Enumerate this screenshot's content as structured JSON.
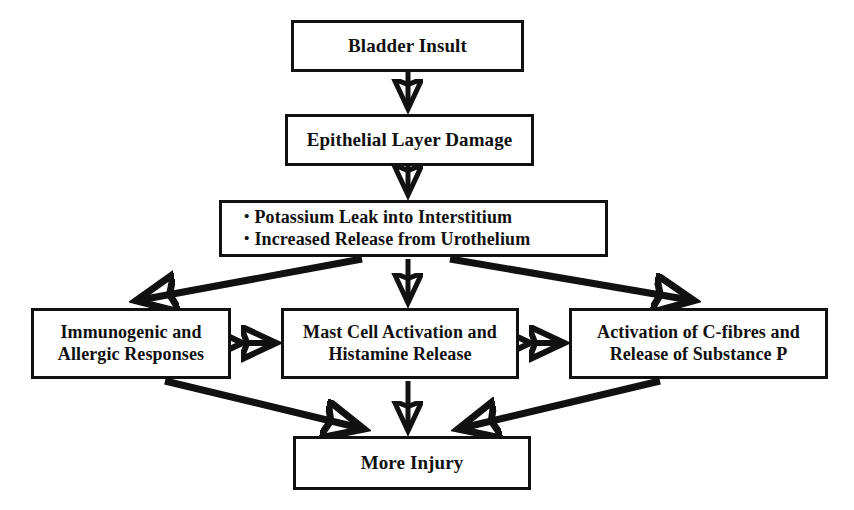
{
  "diagram": {
    "background_color": "#ffffff",
    "stroke_color": "#111111",
    "box_fill_color": "#ffffff",
    "nodes": [
      {
        "id": "bladder-insult",
        "lines": [
          "Bladder Insult"
        ],
        "x": 291,
        "y": 20,
        "w": 233,
        "h": 52,
        "font_size": 19
      },
      {
        "id": "epithelial-layer-damage",
        "lines": [
          "Epithelial Layer Damage"
        ],
        "x": 285,
        "y": 114,
        "w": 249,
        "h": 52,
        "font_size": 19
      },
      {
        "id": "potassium-leak",
        "lines": [
          "Potassium Leak into Interstitium",
          "Increased Release from Urothelium"
        ],
        "x": 219,
        "y": 200,
        "w": 389,
        "h": 57,
        "font_size": 18
      },
      {
        "id": "immunogenic-allergic",
        "lines": [
          "Immunogenic and",
          "Allergic Responses"
        ],
        "x": 31,
        "y": 308,
        "w": 200,
        "h": 71,
        "font_size": 18
      },
      {
        "id": "mast-cell-histamine",
        "lines": [
          "Mast Cell Activation and",
          "Histamine Release"
        ],
        "x": 281,
        "y": 308,
        "w": 238,
        "h": 71,
        "font_size": 18
      },
      {
        "id": "c-fibres-substance-p",
        "lines": [
          "Activation of C-fibres and",
          "Release of Substance P"
        ],
        "x": 569,
        "y": 308,
        "w": 259,
        "h": 71,
        "font_size": 18
      },
      {
        "id": "more-injury",
        "lines": [
          "More Injury"
        ],
        "x": 293,
        "y": 436,
        "w": 238,
        "h": 54,
        "font_size": 19
      }
    ],
    "edges": [
      {
        "id": "insult-to-epithelial",
        "from": "bladder-insult",
        "to": "epithelial-layer-damage",
        "type": "single-arrow",
        "direction": "down"
      },
      {
        "id": "epithelial-to-potassium",
        "from": "epithelial-layer-damage",
        "to": "potassium-leak",
        "type": "single-arrow",
        "direction": "down"
      },
      {
        "id": "potassium-to-immunogenic",
        "from": "potassium-leak",
        "to": "immunogenic-allergic",
        "type": "single-arrow",
        "direction": "down-left"
      },
      {
        "id": "potassium-to-mast-cell",
        "from": "potassium-leak",
        "to": "mast-cell-histamine",
        "type": "single-arrow",
        "direction": "down"
      },
      {
        "id": "potassium-to-c-fibres",
        "from": "potassium-leak",
        "to": "c-fibres-substance-p",
        "type": "single-arrow",
        "direction": "down-right"
      },
      {
        "id": "immunogenic-mast-cell-link",
        "from": "immunogenic-allergic",
        "to": "mast-cell-histamine",
        "type": "double-arrow",
        "direction": "horizontal"
      },
      {
        "id": "mast-cell-c-fibres-link",
        "from": "mast-cell-histamine",
        "to": "c-fibres-substance-p",
        "type": "double-arrow",
        "direction": "horizontal"
      },
      {
        "id": "immunogenic-to-more-injury",
        "from": "immunogenic-allergic",
        "to": "more-injury",
        "type": "single-arrow",
        "direction": "down-right"
      },
      {
        "id": "mast-cell-to-more-injury",
        "from": "mast-cell-histamine",
        "to": "more-injury",
        "type": "single-arrow",
        "direction": "down"
      },
      {
        "id": "c-fibres-to-more-injury",
        "from": "c-fibres-substance-p",
        "to": "more-injury",
        "type": "single-arrow",
        "direction": "down-left"
      }
    ]
  }
}
